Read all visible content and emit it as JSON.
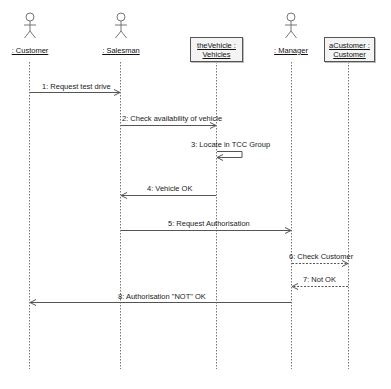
{
  "diagram": {
    "type": "UML sequence diagram",
    "participants": [
      {
        "id": "customer",
        "kind": "actor",
        "label": ": Customer",
        "x": 29
      },
      {
        "id": "salesman",
        "kind": "actor",
        "label": ": Salesman",
        "x": 120
      },
      {
        "id": "vehicle",
        "kind": "object",
        "line1": "theVehicle :",
        "line2": "Vehicles",
        "x": 216
      },
      {
        "id": "manager",
        "kind": "actor",
        "label": ": Manager",
        "x": 291
      },
      {
        "id": "acustomer",
        "kind": "object",
        "line1": "aCustomer :",
        "line2": "Customer",
        "x": 348
      }
    ],
    "messages": [
      {
        "n": 1,
        "label": "1: Request test drive",
        "from": "customer",
        "to": "salesman",
        "style": "solid"
      },
      {
        "n": 2,
        "label": "2: Check availability of vehicle",
        "from": "salesman",
        "to": "vehicle",
        "style": "solid"
      },
      {
        "n": 3,
        "label": "3: Locate in TCC Group",
        "from": "vehicle",
        "to": "vehicle",
        "style": "self"
      },
      {
        "n": 4,
        "label": "4: Vehicle OK",
        "from": "vehicle",
        "to": "salesman",
        "style": "solid"
      },
      {
        "n": 5,
        "label": "5: Request Authorisation",
        "from": "salesman",
        "to": "manager",
        "style": "solid"
      },
      {
        "n": 6,
        "label": "6: Check Customer",
        "from": "manager",
        "to": "acustomer",
        "style": "dashed"
      },
      {
        "n": 7,
        "label": "7: Not OK",
        "from": "acustomer",
        "to": "manager",
        "style": "dashed"
      },
      {
        "n": 8,
        "label": "8: Authorisation \"NOT\" OK",
        "from": "manager",
        "to": "customer",
        "style": "solid"
      }
    ]
  }
}
